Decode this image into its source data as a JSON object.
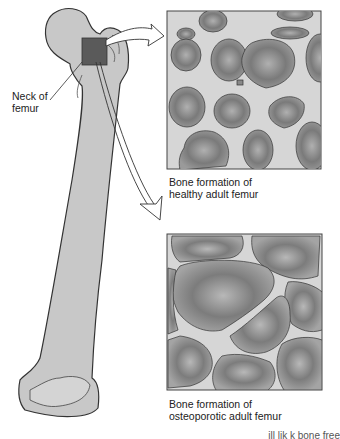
{
  "diagram": {
    "labels": {
      "neck_line1": "Neck of",
      "neck_line2": "femur"
    },
    "panels": [
      {
        "id": "healthy",
        "caption_line1": "Bone formation of",
        "caption_line2": "healthy adult femur"
      },
      {
        "id": "osteoporotic",
        "caption_line1": "Bone formation of",
        "caption_line2": "osteoporotic adult femur"
      }
    ],
    "footer_fragment": "ill lik  k bone free",
    "colors": {
      "bone": "#c8c8c8",
      "bone_outline": "#333333",
      "marrow_dark": "#6e6e6e",
      "marrow_light": "#b4b4b4",
      "trabecula": "#d6d6d6",
      "highlight_square": "#5a5a5a"
    }
  }
}
